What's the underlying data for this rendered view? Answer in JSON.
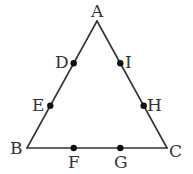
{
  "diagram": {
    "type": "equilateral-triangle-with-trisection-points",
    "colors": {
      "stroke": "#333333",
      "point": "#111111",
      "label": "#333333",
      "background": "#ffffff"
    },
    "vertices": [
      {
        "id": "A",
        "label": "A"
      },
      {
        "id": "B",
        "label": "B"
      },
      {
        "id": "C",
        "label": "C"
      }
    ],
    "edges": [
      {
        "from": "A",
        "to": "B"
      },
      {
        "from": "B",
        "to": "C"
      },
      {
        "from": "C",
        "to": "A"
      }
    ],
    "points": [
      {
        "id": "D",
        "label": "D",
        "on_edge": [
          "A",
          "B"
        ],
        "fraction_from_start": 0.3333
      },
      {
        "id": "E",
        "label": "E",
        "on_edge": [
          "A",
          "B"
        ],
        "fraction_from_start": 0.6667
      },
      {
        "id": "F",
        "label": "F",
        "on_edge": [
          "B",
          "C"
        ],
        "fraction_from_start": 0.3333
      },
      {
        "id": "G",
        "label": "G",
        "on_edge": [
          "B",
          "C"
        ],
        "fraction_from_start": 0.6667
      },
      {
        "id": "H",
        "label": "H",
        "on_edge": [
          "C",
          "A"
        ],
        "fraction_from_start": 0.3333
      },
      {
        "id": "I",
        "label": "I",
        "on_edge": [
          "C",
          "A"
        ],
        "fraction_from_start": 0.6667
      }
    ]
  }
}
